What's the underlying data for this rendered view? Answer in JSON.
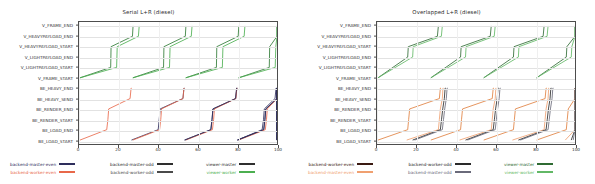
{
  "chart_data": [
    {
      "type": "line",
      "title": "Serial L+R (diesel)",
      "xlabel": "",
      "ylabel": "",
      "xlim": [
        0,
        100
      ],
      "xticks": [
        0,
        20,
        40,
        60,
        80,
        100
      ],
      "grid": true,
      "legend_position": "bottom",
      "categories": [
        "BE_LOAD_START",
        "BE_LOAD_END",
        "BE_RENDER_START",
        "BE_RENDER_END",
        "BE_HEAVY_SEND",
        "BE_HEAVY_END",
        "V_FRAME_START",
        "V_LIGHTPAYLOAD_START",
        "V_LIGHTPAYLOAD_END",
        "V_HEAVYPAYLOAD_START",
        "V_HEAVYPAYLOAD_END",
        "V_FRAME_END"
      ],
      "series": [
        {
          "name": "backend-master-even",
          "color": "#2e2e5c",
          "points": [
            [
              26.5,
              0
            ],
            [
              40.0,
              1
            ],
            [
              40.5,
              2
            ],
            [
              41.0,
              3
            ],
            [
              52.5,
              4
            ],
            [
              53.0,
              5
            ],
            [
              53.2,
              5
            ]
          ]
        },
        {
          "name": "backend-worker-even",
          "color": "#e8684a",
          "points": [
            [
              0.5,
              0
            ],
            [
              14.0,
              1
            ],
            [
              14.6,
              2
            ],
            [
              15.0,
              3
            ],
            [
              25.8,
              4
            ],
            [
              26.3,
              5
            ],
            [
              26.5,
              5
            ]
          ]
        },
        {
          "name": "backend-master-odd",
          "color": "#2e2e5c",
          "points": [
            [
              80.0,
              0
            ],
            [
              92.5,
              1
            ],
            [
              93.2,
              2
            ],
            [
              93.6,
              3
            ],
            [
              99.0,
              4
            ],
            [
              99.5,
              5
            ],
            [
              99.8,
              5
            ]
          ]
        },
        {
          "name": "backend-worker-odd",
          "color": "#2e2e5c",
          "points": [
            [
              53.5,
              0
            ],
            [
              66.5,
              1
            ],
            [
              67.2,
              2
            ],
            [
              67.6,
              3
            ],
            [
              79.0,
              4
            ],
            [
              79.6,
              5
            ],
            [
              79.9,
              5
            ]
          ]
        },
        {
          "name": "viewer-master",
          "color": "#2f7a35",
          "points": [
            [
              0.5,
              6
            ],
            [
              16.0,
              7
            ],
            [
              16.2,
              9
            ],
            [
              27.0,
              10
            ],
            [
              27.3,
              11
            ]
          ]
        },
        {
          "name": "viewer-worker",
          "color": "#4caf50",
          "points": [
            [
              0.5,
              6
            ],
            [
              19.0,
              7
            ],
            [
              19.3,
              9
            ],
            [
              30.0,
              10
            ],
            [
              30.4,
              11
            ]
          ]
        }
      ],
      "legend": [
        {
          "label": "backend-master-even",
          "color": "#2e2e5c"
        },
        {
          "label": "backend-worker-even",
          "color": "#e8684a"
        },
        {
          "label": "backend-master-odd",
          "color": "#2e2e2e"
        },
        {
          "label": "backend-worker-odd",
          "color": "#4a4a4a"
        },
        {
          "label": "viewer-master",
          "color": "#2f2f2f"
        },
        {
          "label": "viewer-worker",
          "color": "#4caf50"
        }
      ]
    },
    {
      "type": "line",
      "title": "Overlapped L+R (diesel)",
      "xlabel": "",
      "ylabel": "",
      "xlim": [
        0,
        100
      ],
      "xticks": [
        0,
        20,
        40,
        60,
        80,
        100
      ],
      "grid": true,
      "legend_position": "bottom",
      "categories": [
        "BE_LOAD_START",
        "BE_LOAD_END",
        "BE_RENDER_START",
        "BE_RENDER_END",
        "BE_HEAVY_SEND",
        "BE_HEAVY_END",
        "V_FRAME_START",
        "V_LIGHTPAYLOAD_START",
        "V_LIGHTPAYLOAD_END",
        "V_HEAVYPAYLOAD_START",
        "V_HEAVYPAYLOAD_END",
        "V_FRAME_END"
      ],
      "series": [
        {
          "name": "backend-worker-even",
          "color": "#e0803f",
          "points": [
            [
              0.5,
              0
            ],
            [
              15.5,
              1
            ],
            [
              16.0,
              2
            ],
            [
              16.5,
              3
            ],
            [
              31.5,
              4
            ],
            [
              32.0,
              5
            ],
            [
              32.3,
              5
            ]
          ]
        },
        {
          "name": "backend-master-even",
          "color": "#f0a070",
          "points": [
            [
              15.0,
              0
            ],
            [
              31.0,
              1
            ],
            [
              31.5,
              2
            ],
            [
              32.0,
              3
            ],
            [
              33.0,
              4
            ],
            [
              33.3,
              5
            ],
            [
              33.5,
              5
            ]
          ]
        },
        {
          "name": "backend-worker-odd",
          "color": "#2a2a2a",
          "points": [
            [
              18.0,
              0
            ],
            [
              32.0,
              1
            ],
            [
              32.6,
              2
            ],
            [
              33.2,
              3
            ],
            [
              34.0,
              4
            ],
            [
              34.4,
              5
            ],
            [
              34.7,
              5
            ]
          ]
        },
        {
          "name": "backend-master-odd",
          "color": "#6a6a7a",
          "points": [
            [
              19.0,
              0
            ],
            [
              33.0,
              1
            ],
            [
              33.6,
              2
            ],
            [
              34.2,
              3
            ],
            [
              35.0,
              4
            ],
            [
              35.4,
              5
            ],
            [
              35.7,
              5
            ]
          ]
        },
        {
          "name": "viewer-master",
          "color": "#2f6b33",
          "points": [
            [
              0.5,
              6
            ],
            [
              15.5,
              8
            ],
            [
              15.8,
              9
            ],
            [
              30.5,
              10
            ],
            [
              31.0,
              11
            ]
          ]
        },
        {
          "name": "viewer-worker",
          "color": "#62b866",
          "points": [
            [
              0.5,
              6
            ],
            [
              18.0,
              8
            ],
            [
              18.3,
              9
            ],
            [
              32.5,
              10
            ],
            [
              33.0,
              11
            ]
          ]
        }
      ],
      "legend": [
        {
          "label": "backend-worker-even",
          "color": "#3a1a12"
        },
        {
          "label": "backend-master-even",
          "color": "#f0a070"
        },
        {
          "label": "backend-worker-odd",
          "color": "#2a2a2a"
        },
        {
          "label": "backend-master-odd",
          "color": "#6a6a7a"
        },
        {
          "label": "viewer-master",
          "color": "#2f6b33"
        },
        {
          "label": "viewer-worker",
          "color": "#62b866"
        }
      ]
    }
  ]
}
